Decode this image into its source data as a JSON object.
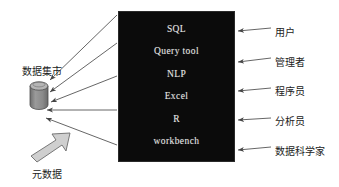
{
  "diagram": {
    "tool_box": {
      "name": "tools-box",
      "background_color": "#0b0b0b",
      "text_color": "#e8e8e8",
      "items": [
        {
          "label": "SQL"
        },
        {
          "label": "Query tool"
        },
        {
          "label": "NLP"
        },
        {
          "label": "Excel"
        },
        {
          "label": "R"
        },
        {
          "label": "workbench"
        }
      ]
    },
    "left": {
      "data_mart_label": "数据集市",
      "metadata_label": "元数据",
      "cylinder_color": "#8c8c8c",
      "block_arrow_color": "#c9c9c9"
    },
    "roles": [
      {
        "label": "用户"
      },
      {
        "label": "管理者"
      },
      {
        "label": "程序员"
      },
      {
        "label": "分析员"
      },
      {
        "label": "数据科学家"
      }
    ],
    "line_color": "#555555"
  }
}
